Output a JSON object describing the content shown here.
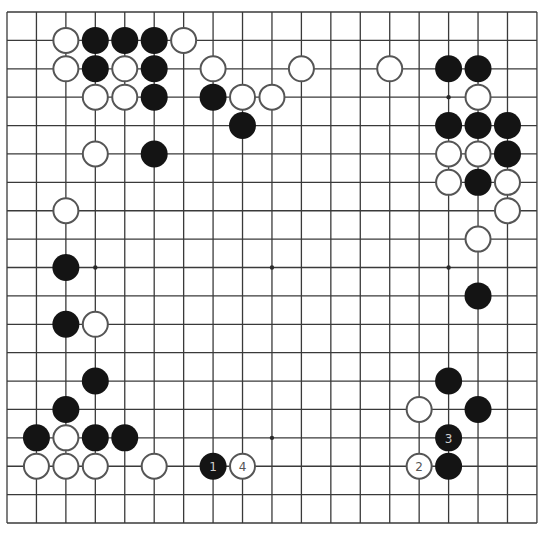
{
  "board": {
    "size": 19,
    "origin": {
      "x": 7,
      "y": 12
    },
    "spacing": {
      "x": 29.44,
      "y": 28.39
    },
    "stone_radius": 13.5,
    "colors": {
      "black": "#141414",
      "white": "#ffffff",
      "line": "#3a3a3a",
      "white_outline": "#555555"
    },
    "star_points": [
      [
        3,
        3
      ],
      [
        9,
        3
      ],
      [
        15,
        3
      ],
      [
        3,
        9
      ],
      [
        9,
        9
      ],
      [
        15,
        9
      ],
      [
        3,
        15
      ],
      [
        9,
        15
      ],
      [
        15,
        15
      ]
    ],
    "black_stones": [
      [
        3,
        1
      ],
      [
        4,
        1
      ],
      [
        5,
        1
      ],
      [
        3,
        2
      ],
      [
        5,
        2
      ],
      [
        5,
        3
      ],
      [
        7,
        3
      ],
      [
        8,
        4
      ],
      [
        5,
        5
      ],
      [
        15,
        2
      ],
      [
        16,
        2
      ],
      [
        15,
        4
      ],
      [
        16,
        4
      ],
      [
        17,
        4
      ],
      [
        17,
        5
      ],
      [
        16,
        6
      ],
      [
        2,
        9
      ],
      [
        16,
        10
      ],
      [
        2,
        11
      ],
      [
        3,
        13
      ],
      [
        15,
        13
      ],
      [
        2,
        14
      ],
      [
        16,
        14
      ],
      [
        1,
        15
      ],
      [
        3,
        15
      ],
      [
        4,
        15
      ],
      [
        15,
        16
      ]
    ],
    "white_stones": [
      [
        2,
        1
      ],
      [
        6,
        1
      ],
      [
        2,
        2
      ],
      [
        4,
        2
      ],
      [
        7,
        2
      ],
      [
        10,
        2
      ],
      [
        13,
        2
      ],
      [
        3,
        3
      ],
      [
        4,
        3
      ],
      [
        8,
        3
      ],
      [
        9,
        3
      ],
      [
        16,
        3
      ],
      [
        3,
        5
      ],
      [
        15,
        5
      ],
      [
        16,
        5
      ],
      [
        15,
        6
      ],
      [
        17,
        6
      ],
      [
        17,
        7
      ],
      [
        16,
        8
      ],
      [
        2,
        7
      ],
      [
        3,
        11
      ],
      [
        14,
        14
      ],
      [
        2,
        15
      ],
      [
        1,
        16
      ],
      [
        2,
        16
      ],
      [
        3,
        16
      ],
      [
        5,
        16
      ]
    ],
    "numbered_moves": [
      {
        "number": "1",
        "color": "black",
        "col": 7,
        "row": 16
      },
      {
        "number": "2",
        "color": "white",
        "col": 14,
        "row": 16
      },
      {
        "number": "3",
        "color": "black",
        "col": 15,
        "row": 15
      },
      {
        "number": "4",
        "color": "white",
        "col": 8,
        "row": 16
      }
    ]
  }
}
